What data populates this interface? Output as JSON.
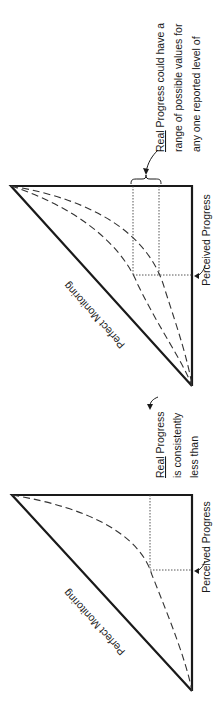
{
  "diagrams": [
    {
      "id": "top",
      "hypotenuse_label": "Perfect Monitoring",
      "axis_label": "Perceived Progress",
      "annotation": {
        "underlined": "Real",
        "lines": [
          " Progress could have a",
          "range of possible values for",
          "any one reported level of"
        ]
      },
      "curves": 2
    },
    {
      "id": "bottom",
      "hypotenuse_label": "Perfect Monitoring",
      "axis_label": "Perceived Progress",
      "annotation": {
        "underlined": "Real",
        "lines": [
          " Progress",
          "is consistently",
          "less than"
        ]
      },
      "curves": 1
    }
  ],
  "colors": {
    "line": "#1a1a1a",
    "background": "#ffffff"
  }
}
